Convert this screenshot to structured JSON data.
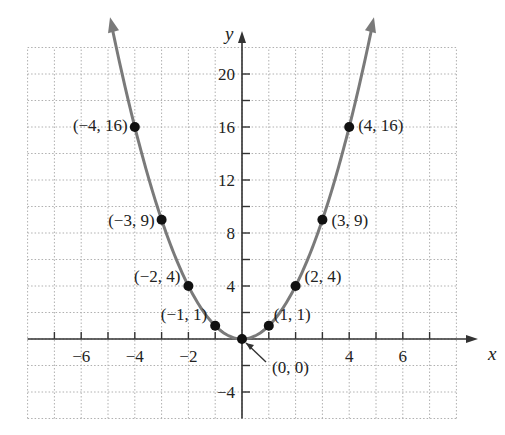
{
  "chart_data": {
    "type": "line",
    "title": "",
    "function": "y = x^2",
    "xlabel": "x",
    "ylabel": "y",
    "xlim": [
      -8,
      8
    ],
    "ylim": [
      -6,
      22
    ],
    "grid": true,
    "x_ticks": [
      -6,
      -4,
      -2,
      4,
      6
    ],
    "y_ticks": [
      20,
      16,
      12,
      8,
      4,
      -4
    ],
    "points": [
      {
        "x": -4,
        "y": 16,
        "label": "(−4, 16)"
      },
      {
        "x": -3,
        "y": 9,
        "label": "(−3, 9)"
      },
      {
        "x": -2,
        "y": 4,
        "label": "(−2, 4)"
      },
      {
        "x": -1,
        "y": 1,
        "label": "(−1, 1)"
      },
      {
        "x": 0,
        "y": 0,
        "label": "(0, 0)"
      },
      {
        "x": 1,
        "y": 1,
        "label": "(1, 1)"
      },
      {
        "x": 2,
        "y": 4,
        "label": "(2, 4)"
      },
      {
        "x": 3,
        "y": 9,
        "label": "(3, 9)"
      },
      {
        "x": 4,
        "y": 16,
        "label": "(4, 16)"
      }
    ],
    "series": [
      {
        "name": "y = x^2",
        "x": [
          -4,
          -3,
          -2,
          -1,
          0,
          1,
          2,
          3,
          4
        ],
        "values": [
          16,
          9,
          4,
          1,
          0,
          1,
          4,
          9,
          16
        ]
      }
    ],
    "colors": {
      "curve": "#7a7a7a",
      "point": "#111111",
      "axis": "#333333",
      "grid": "#b0b0b0"
    }
  }
}
